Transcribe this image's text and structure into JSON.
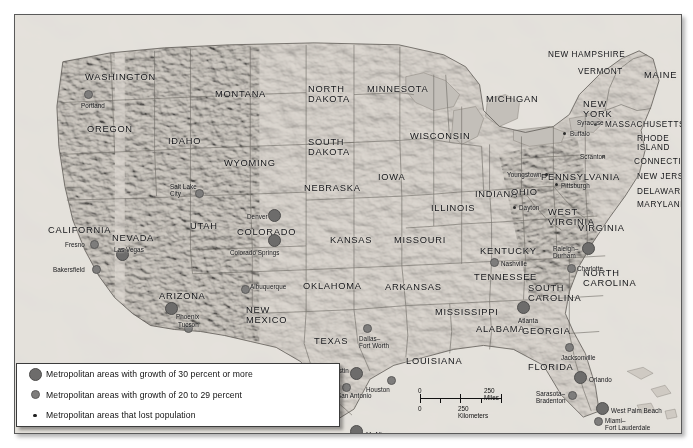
{
  "legend": {
    "items": [
      {
        "key": "big",
        "label": "Metropolitan areas with growth of 30 percent or more"
      },
      {
        "key": "med",
        "label": "Metropolitan areas with growth of 20 to 29 percent"
      },
      {
        "key": "tiny",
        "label": "Metropolitan areas that lost population"
      }
    ]
  },
  "scale": {
    "miles_zero": "0",
    "miles_label": "250 Miles",
    "km_zero": "0",
    "km_label": "250 Kilometers"
  },
  "states": [
    {
      "name": "WASHINGTON",
      "x": 70,
      "y": 58,
      "size": "n"
    },
    {
      "name": "OREGON",
      "x": 72,
      "y": 110,
      "size": "n"
    },
    {
      "name": "IDAHO",
      "x": 153,
      "y": 122,
      "size": "n"
    },
    {
      "name": "MONTANA",
      "x": 200,
      "y": 75,
      "size": "n"
    },
    {
      "name": "NEVADA",
      "x": 97,
      "y": 219,
      "size": "n"
    },
    {
      "name": "CALIFORNIA",
      "x": 33,
      "y": 211,
      "size": "n"
    },
    {
      "name": "UTAH",
      "x": 175,
      "y": 207,
      "size": "n"
    },
    {
      "name": "WYOMING",
      "x": 209,
      "y": 144,
      "size": "n"
    },
    {
      "name": "ARIZONA",
      "x": 144,
      "y": 277,
      "size": "n"
    },
    {
      "name": "NEW\nMEXICO",
      "x": 231,
      "y": 290,
      "size": "n"
    },
    {
      "name": "COLORADO",
      "x": 222,
      "y": 213,
      "size": "n"
    },
    {
      "name": "NORTH\nDAKOTA",
      "x": 293,
      "y": 69,
      "size": "n"
    },
    {
      "name": "SOUTH\nDAKOTA",
      "x": 293,
      "y": 122,
      "size": "n"
    },
    {
      "name": "NEBRASKA",
      "x": 289,
      "y": 169,
      "size": "n"
    },
    {
      "name": "KANSAS",
      "x": 315,
      "y": 221,
      "size": "n"
    },
    {
      "name": "OKLAHOMA",
      "x": 288,
      "y": 267,
      "size": "n"
    },
    {
      "name": "TEXAS",
      "x": 299,
      "y": 322,
      "size": "n"
    },
    {
      "name": "MINNESOTA",
      "x": 352,
      "y": 70,
      "size": "n"
    },
    {
      "name": "IOWA",
      "x": 363,
      "y": 158,
      "size": "n"
    },
    {
      "name": "MISSOURI",
      "x": 379,
      "y": 221,
      "size": "n"
    },
    {
      "name": "ARKANSAS",
      "x": 370,
      "y": 268,
      "size": "n"
    },
    {
      "name": "LOUISIANA",
      "x": 391,
      "y": 342,
      "size": "n"
    },
    {
      "name": "WISCONSIN",
      "x": 395,
      "y": 117,
      "size": "n"
    },
    {
      "name": "ILLINOIS",
      "x": 416,
      "y": 189,
      "size": "n"
    },
    {
      "name": "MISSISSIPPI",
      "x": 420,
      "y": 293,
      "size": "n"
    },
    {
      "name": "ALABAMA",
      "x": 461,
      "y": 310,
      "size": "n"
    },
    {
      "name": "MICHIGAN",
      "x": 471,
      "y": 80,
      "size": "n"
    },
    {
      "name": "INDIANA",
      "x": 460,
      "y": 175,
      "size": "n"
    },
    {
      "name": "OHIO",
      "x": 496,
      "y": 173,
      "size": "n"
    },
    {
      "name": "KENTUCKY",
      "x": 465,
      "y": 232,
      "size": "n"
    },
    {
      "name": "TENNESSEE",
      "x": 459,
      "y": 258,
      "size": "n"
    },
    {
      "name": "GEORGIA",
      "x": 507,
      "y": 312,
      "size": "n"
    },
    {
      "name": "FLORIDA",
      "x": 513,
      "y": 348,
      "size": "n"
    },
    {
      "name": "SOUTH\nCAROLINA",
      "x": 513,
      "y": 268,
      "size": "n"
    },
    {
      "name": "NORTH\nCAROLINA",
      "x": 568,
      "y": 253,
      "size": "n"
    },
    {
      "name": "WEST\nVIRGINIA",
      "x": 533,
      "y": 192,
      "size": "n"
    },
    {
      "name": "VIRGINIA",
      "x": 563,
      "y": 209,
      "size": "n"
    },
    {
      "name": "PENNSYLVANIA",
      "x": 526,
      "y": 158,
      "size": "n"
    },
    {
      "name": "NEW\nYORK",
      "x": 568,
      "y": 84,
      "size": "n"
    },
    {
      "name": "MAINE",
      "x": 629,
      "y": 56,
      "size": "n"
    },
    {
      "name": "VERMONT",
      "x": 563,
      "y": 53,
      "size": "sm"
    },
    {
      "name": "NEW HAMPSHIRE",
      "x": 533,
      "y": 36,
      "size": "sm"
    },
    {
      "name": "MASSACHUSETTS",
      "x": 590,
      "y": 106,
      "size": "sm"
    },
    {
      "name": "RHODE\nISLAND",
      "x": 622,
      "y": 120,
      "size": "sm"
    },
    {
      "name": "CONNECTICUT",
      "x": 619,
      "y": 143,
      "size": "sm"
    },
    {
      "name": "NEW JERSEY",
      "x": 622,
      "y": 158,
      "size": "sm"
    },
    {
      "name": "DELAWARE",
      "x": 622,
      "y": 173,
      "size": "sm"
    },
    {
      "name": "MARYLAND",
      "x": 622,
      "y": 186,
      "size": "sm"
    }
  ],
  "cities": [
    {
      "name": "Portland",
      "cat": "med",
      "dx": 72,
      "dy": 78,
      "lx": 66,
      "ly": 87,
      "align": "left"
    },
    {
      "name": "Salt Lake\nCity",
      "cat": "med",
      "dx": 183,
      "dy": 177,
      "lx": 155,
      "ly": 168,
      "align": "left"
    },
    {
      "name": "Fresno",
      "cat": "med",
      "dx": 78,
      "dy": 228,
      "lx": 50,
      "ly": 226,
      "align": "left"
    },
    {
      "name": "Bakersfield",
      "cat": "med",
      "dx": 80,
      "dy": 253,
      "lx": 38,
      "ly": 251,
      "align": "left"
    },
    {
      "name": "Las Vegas",
      "cat": "big",
      "dx": 106,
      "dy": 238,
      "lx": 99,
      "ly": 231,
      "align": "left"
    },
    {
      "name": "Phoenix",
      "cat": "big",
      "dx": 155,
      "dy": 292,
      "lx": 161,
      "ly": 298,
      "align": "left"
    },
    {
      "name": "Tucson",
      "cat": "med",
      "dx": 172,
      "dy": 312,
      "lx": 163,
      "ly": 306,
      "align": "left"
    },
    {
      "name": "Albuquerque",
      "cat": "med",
      "dx": 229,
      "dy": 273,
      "lx": 235,
      "ly": 268,
      "align": "left"
    },
    {
      "name": "Denver",
      "cat": "big",
      "dx": 258,
      "dy": 199,
      "lx": 232,
      "ly": 198,
      "align": "left"
    },
    {
      "name": "Colorado Springs",
      "cat": "big",
      "dx": 258,
      "dy": 224,
      "lx": 215,
      "ly": 234,
      "align": "left"
    },
    {
      "name": "Dallas–\nFort Worth",
      "cat": "med",
      "dx": 351,
      "dy": 312,
      "lx": 344,
      "ly": 320,
      "align": "left"
    },
    {
      "name": "Austin",
      "cat": "big",
      "dx": 340,
      "dy": 357,
      "lx": 316,
      "ly": 352,
      "align": "left"
    },
    {
      "name": "San Antonio",
      "cat": "med",
      "dx": 330,
      "dy": 371,
      "lx": 322,
      "ly": 377,
      "align": "left"
    },
    {
      "name": "Houston",
      "cat": "med",
      "dx": 375,
      "dy": 364,
      "lx": 351,
      "ly": 371,
      "align": "left"
    },
    {
      "name": "McAllen",
      "cat": "big",
      "dx": 340,
      "dy": 415,
      "lx": 351,
      "ly": 416,
      "align": "left"
    },
    {
      "name": "Nashville",
      "cat": "med",
      "dx": 478,
      "dy": 246,
      "lx": 486,
      "ly": 245,
      "align": "left"
    },
    {
      "name": "Atlanta",
      "cat": "big",
      "dx": 507,
      "dy": 291,
      "lx": 503,
      "ly": 302,
      "align": "left"
    },
    {
      "name": "Charlotte",
      "cat": "med",
      "dx": 555,
      "dy": 252,
      "lx": 562,
      "ly": 250,
      "align": "left"
    },
    {
      "name": "Raleigh–\nDurham",
      "cat": "big",
      "dx": 572,
      "dy": 232,
      "lx": 538,
      "ly": 230,
      "align": "left"
    },
    {
      "name": "Jacksonville",
      "cat": "med",
      "dx": 553,
      "dy": 331,
      "lx": 546,
      "ly": 339,
      "align": "left"
    },
    {
      "name": "Orlando",
      "cat": "big",
      "dx": 564,
      "dy": 361,
      "lx": 574,
      "ly": 361,
      "align": "left"
    },
    {
      "name": "Sarasota–\nBradenton",
      "cat": "med",
      "dx": 556,
      "dy": 379,
      "lx": 521,
      "ly": 375,
      "align": "left"
    },
    {
      "name": "West Palm Beach",
      "cat": "big",
      "dx": 586,
      "dy": 392,
      "lx": 596,
      "ly": 392,
      "align": "left"
    },
    {
      "name": "Miami–\nFort Lauderdale",
      "cat": "med",
      "dx": 582,
      "dy": 405,
      "lx": 590,
      "ly": 402,
      "align": "left"
    },
    {
      "name": "Buffalo",
      "cat": "tiny",
      "dx": 549,
      "dy": 118,
      "lx": 555,
      "ly": 115,
      "align": "left"
    },
    {
      "name": "Syracuse",
      "cat": "tiny",
      "dx": 580,
      "dy": 109,
      "lx": 562,
      "ly": 104,
      "align": "left"
    },
    {
      "name": "Scranton",
      "cat": "tiny",
      "dx": 588,
      "dy": 141,
      "lx": 565,
      "ly": 138,
      "align": "left"
    },
    {
      "name": "Youngstown",
      "cat": "tiny",
      "dx": 531,
      "dy": 159,
      "lx": 492,
      "ly": 156,
      "align": "left"
    },
    {
      "name": "Pittsburgh",
      "cat": "tiny",
      "dx": 541,
      "dy": 169,
      "lx": 546,
      "ly": 167,
      "align": "left"
    },
    {
      "name": "Dayton",
      "cat": "tiny",
      "dx": 499,
      "dy": 192,
      "lx": 504,
      "ly": 189,
      "align": "left"
    }
  ]
}
